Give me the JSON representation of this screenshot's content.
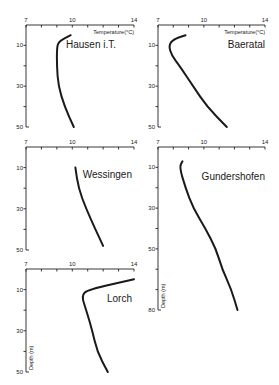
{
  "chart_data": [
    {
      "type": "line",
      "title": "Hausen i.T.",
      "xlabel": "Temperature (°C)",
      "ylabel": "",
      "xlim": [
        7,
        14
      ],
      "ylim": [
        0,
        50
      ],
      "x_ticks": [
        7,
        10,
        14
      ],
      "y_ticks": [
        10,
        30,
        50
      ],
      "series": [
        {
          "name": "Hausen i.T.",
          "x": [
            9.9,
            9.1,
            9.0,
            9.0,
            9.1,
            9.5,
            10.1
          ],
          "y": [
            5,
            8,
            12,
            20,
            30,
            40,
            50
          ]
        }
      ]
    },
    {
      "type": "line",
      "title": "Baeratal",
      "xlabel": "Temperature (°C)",
      "ylabel": "",
      "xlim": [
        7,
        14
      ],
      "ylim": [
        0,
        50
      ],
      "x_ticks": [
        7,
        10,
        14
      ],
      "y_ticks": [
        10,
        30,
        50
      ],
      "series": [
        {
          "name": "Baeratal",
          "x": [
            8.8,
            8.0,
            7.7,
            7.9,
            8.4,
            9.3,
            10.2,
            11.5
          ],
          "y": [
            5,
            7,
            10,
            15,
            20,
            30,
            40,
            50
          ]
        }
      ]
    },
    {
      "type": "line",
      "title": "Wessingen",
      "xlabel": "",
      "ylabel": "",
      "xlim": [
        7,
        14
      ],
      "ylim": [
        0,
        50
      ],
      "x_ticks": [
        7,
        10,
        14
      ],
      "y_ticks": [
        10,
        30,
        50
      ],
      "series": [
        {
          "name": "Wessingen",
          "x": [
            10.2,
            10.4,
            10.9,
            11.5,
            12.0
          ],
          "y": [
            10,
            20,
            30,
            40,
            48
          ]
        }
      ]
    },
    {
      "type": "line",
      "title": "Gundershofen",
      "xlabel": "",
      "ylabel": "Depth (m)",
      "xlim": [
        7,
        14
      ],
      "ylim": [
        0,
        80
      ],
      "x_ticks": [
        7,
        10,
        14
      ],
      "y_ticks": [
        10,
        30,
        50,
        80
      ],
      "series": [
        {
          "name": "Gundershofen",
          "x": [
            8.6,
            8.4,
            8.8,
            9.3,
            10.1,
            10.8,
            11.2,
            11.8,
            12.2
          ],
          "y": [
            7,
            10,
            20,
            30,
            40,
            50,
            60,
            70,
            80
          ]
        }
      ]
    },
    {
      "type": "line",
      "title": "Lorch",
      "xlabel": "",
      "ylabel": "Depth (m)",
      "xlim": [
        7,
        14
      ],
      "ylim": [
        0,
        50
      ],
      "x_ticks": [
        7,
        10,
        14
      ],
      "y_ticks": [
        10,
        30,
        50
      ],
      "series": [
        {
          "name": "Lorch",
          "x": [
            14.0,
            11.0,
            10.6,
            10.9,
            11.3,
            11.6,
            12.3
          ],
          "y": [
            5,
            10,
            13,
            20,
            30,
            40,
            50
          ]
        }
      ]
    }
  ],
  "labels": {
    "temperature_axis": "Temperature(°C)",
    "depth_axis": "Depth (m)",
    "panels": [
      "Hausen i.T.",
      "Baeratal",
      "Wessingen",
      "Gundershofen",
      "Lorch"
    ]
  }
}
